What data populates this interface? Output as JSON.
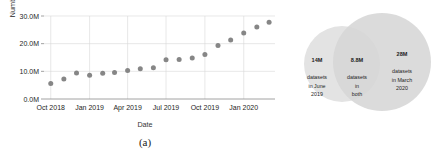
{
  "figure": {
    "panel_a_caption": "(a)",
    "panel_b_caption": "(b)"
  },
  "chart_data": [
    {
      "type": "scatter",
      "title": "",
      "xlabel": "Date",
      "ylabel": "Number of datasets",
      "grid": true,
      "legend": "none",
      "xlim": [
        "2018-09-15",
        "2020-03-15"
      ],
      "ylim": [
        0,
        30000000
      ],
      "ytick_labels": [
        "0.0M",
        "10.0M",
        "20.0M",
        "30.0M"
      ],
      "ytick_values": [
        0,
        10000000,
        20000000,
        30000000
      ],
      "xtick_labels": [
        "Oct 2018",
        "Jan 2019",
        "Apr 2019",
        "Jul 2019",
        "Oct 2019",
        "Jan 2020"
      ],
      "xtick_values": [
        "2018-10-01",
        "2019-01-01",
        "2019-04-01",
        "2019-07-01",
        "2019-10-01",
        "2020-01-01"
      ],
      "marker_color": "#7f7f7f",
      "x": [
        "2018-10-01",
        "2018-11-01",
        "2018-12-01",
        "2019-01-01",
        "2019-02-01",
        "2019-03-01",
        "2019-04-01",
        "2019-05-01",
        "2019-06-01",
        "2019-07-01",
        "2019-08-01",
        "2019-09-01",
        "2019-10-01",
        "2019-11-01",
        "2019-12-01",
        "2020-01-01",
        "2020-02-01",
        "2020-03-01"
      ],
      "values": [
        5600000,
        7200000,
        9400000,
        8600000,
        9300000,
        9600000,
        10300000,
        10900000,
        11300000,
        14200000,
        14300000,
        14800000,
        16100000,
        19300000,
        21300000,
        23900000,
        26000000,
        27700000
      ]
    },
    {
      "type": "venn",
      "title": "",
      "circles": [
        {
          "name": "June 2019",
          "count_label": "14M",
          "text": "datasets\nin June\n2019",
          "color": "#e0e0e0"
        },
        {
          "name": "March 2020",
          "count_label": "28M",
          "text": "datasets\nin March\n2020",
          "color": "#d4d4d4"
        }
      ],
      "intersection": {
        "name": "both",
        "count_label": "8.8M",
        "text": "datasets\nin\nboth",
        "color": "#bdbdbd"
      }
    }
  ]
}
